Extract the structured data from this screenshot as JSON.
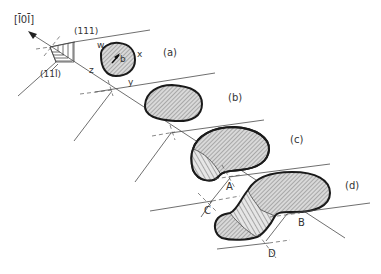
{
  "figure": {
    "direction_label": "[Ī0Ī]",
    "planes": {
      "upper": "(111)",
      "lower": "(11Ī)"
    },
    "edge_labels": {
      "w": "w",
      "x": "x",
      "y": "y",
      "z": "z",
      "b": "b"
    },
    "panels": [
      {
        "id": "a",
        "label": "(a)"
      },
      {
        "id": "b",
        "label": "(b)"
      },
      {
        "id": "c",
        "label": "(c)"
      },
      {
        "id": "d",
        "label": "(d)"
      }
    ],
    "points": {
      "A": "A",
      "B": "B",
      "C": "C",
      "D": "D"
    },
    "colors": {
      "outline": "#1a1a1a",
      "hatch": "#6a6a6a",
      "fill": "#d8d8d8",
      "line": "#4a4a4a"
    }
  }
}
